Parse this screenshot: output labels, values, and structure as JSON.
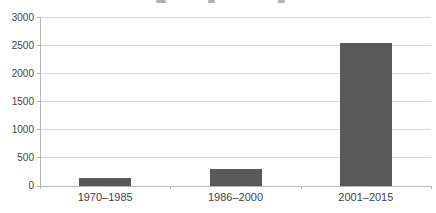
{
  "chart_data": {
    "type": "bar",
    "title": "",
    "title_note": "title cropped out of frame; only three descender fragments visible at top edge",
    "categories": [
      "1970–1985",
      "1986–2000",
      "2001–2015"
    ],
    "values": [
      150,
      300,
      2550
    ],
    "xlabel": "",
    "ylabel": "",
    "ylim": [
      0,
      3000
    ],
    "yticks": [
      0,
      500,
      1000,
      1500,
      2000,
      2500,
      3000
    ],
    "grid": true,
    "legend": false,
    "bar_color": "#595959",
    "gridline_color": "#d9d9d9",
    "axis_color": "#b7b7b7",
    "text_color": "#3f3f3f"
  }
}
